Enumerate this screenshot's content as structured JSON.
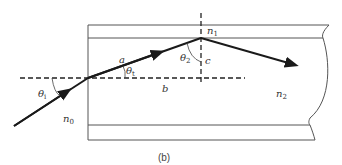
{
  "figure": {
    "caption": "(b)",
    "colors": {
      "ray": "#1a1a1a",
      "outline": "#555555",
      "dashed": "#222222",
      "text": "#333333"
    },
    "labels": {
      "theta_i": {
        "symbol": "θ",
        "sub": "i"
      },
      "theta_t": {
        "symbol": "θ",
        "sub": "t"
      },
      "theta_2": {
        "symbol": "θ",
        "sub": "2"
      },
      "a": "a",
      "b": "b",
      "c": "c",
      "n0": {
        "symbol": "n",
        "sub": "0"
      },
      "n1": {
        "symbol": "n",
        "sub": "1"
      },
      "n2": {
        "symbol": "n",
        "sub": "2"
      }
    }
  }
}
